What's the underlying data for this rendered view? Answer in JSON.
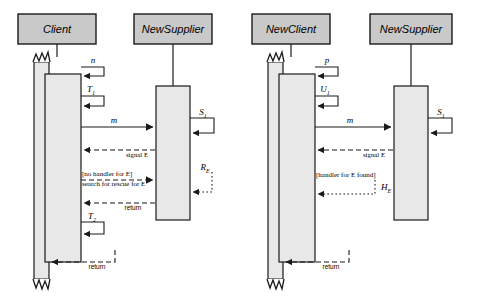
{
  "diagram": {
    "type": "uml-sequence-diagram",
    "colors": {
      "box_fill": "#c9c9c9",
      "activation_fill": "#e8e8e8",
      "stroke": "#1a1a1a",
      "background": "#ffffff"
    },
    "panels": [
      {
        "id": "left",
        "name": "no-handler-scenario",
        "lifelines": [
          {
            "id": "client",
            "label": "Client",
            "x": 80
          },
          {
            "id": "supplier",
            "label": "NewSupplier",
            "x": 196
          }
        ],
        "messages": [
          {
            "id": "n",
            "label": "n",
            "kind": "self-call",
            "actor": "client"
          },
          {
            "id": "t1",
            "label": "T",
            "sub": "1",
            "kind": "self-call",
            "actor": "client"
          },
          {
            "id": "m",
            "label": "m",
            "kind": "call",
            "from": "client",
            "to": "supplier"
          },
          {
            "id": "s1",
            "label": "S",
            "sub": "1",
            "kind": "self-call",
            "actor": "supplier"
          },
          {
            "id": "sigE1",
            "label": "signal E",
            "kind": "dashed-return",
            "from": "supplier",
            "to": "client"
          },
          {
            "id": "search",
            "label": "[no handler for E]",
            "label2": "search for rescue for E",
            "kind": "call-guarded",
            "from": "client",
            "to": "supplier"
          },
          {
            "id": "re",
            "label": "R",
            "sub": "E",
            "kind": "dotted-return",
            "from": "supplier",
            "to": "client"
          },
          {
            "id": "ret1",
            "label": "return",
            "kind": "dashed-return",
            "from": "supplier",
            "to": "client"
          },
          {
            "id": "t2",
            "label": "T",
            "sub": "2",
            "kind": "self-call",
            "actor": "client"
          },
          {
            "id": "ret2",
            "label": "return",
            "kind": "dashed-return",
            "from": "client",
            "to": "client-outer"
          }
        ]
      },
      {
        "id": "right",
        "name": "handler-found-scenario",
        "lifelines": [
          {
            "id": "newclient",
            "label": "NewClient",
            "x": 313
          },
          {
            "id": "supplier2",
            "label": "NewSupplier",
            "x": 428
          }
        ],
        "messages": [
          {
            "id": "p",
            "label": "p",
            "kind": "self-call",
            "actor": "newclient"
          },
          {
            "id": "u1",
            "label": "U",
            "sub": "1",
            "kind": "self-call",
            "actor": "newclient"
          },
          {
            "id": "m2",
            "label": "m",
            "kind": "call",
            "from": "newclient",
            "to": "supplier2"
          },
          {
            "id": "s1b",
            "label": "S",
            "sub": "1",
            "kind": "self-call",
            "actor": "supplier2"
          },
          {
            "id": "sigE2",
            "label": "signal E",
            "kind": "dashed-return",
            "from": "supplier2",
            "to": "newclient"
          },
          {
            "id": "handler",
            "label": "[handler for E found]",
            "kind": "guard"
          },
          {
            "id": "he",
            "label": "H",
            "sub": "E",
            "kind": "dotted-return",
            "from": "supplier2",
            "to": "newclient"
          },
          {
            "id": "ret3",
            "label": "return",
            "kind": "dashed-return",
            "from": "newclient",
            "to": "newclient-outer"
          }
        ]
      }
    ]
  }
}
